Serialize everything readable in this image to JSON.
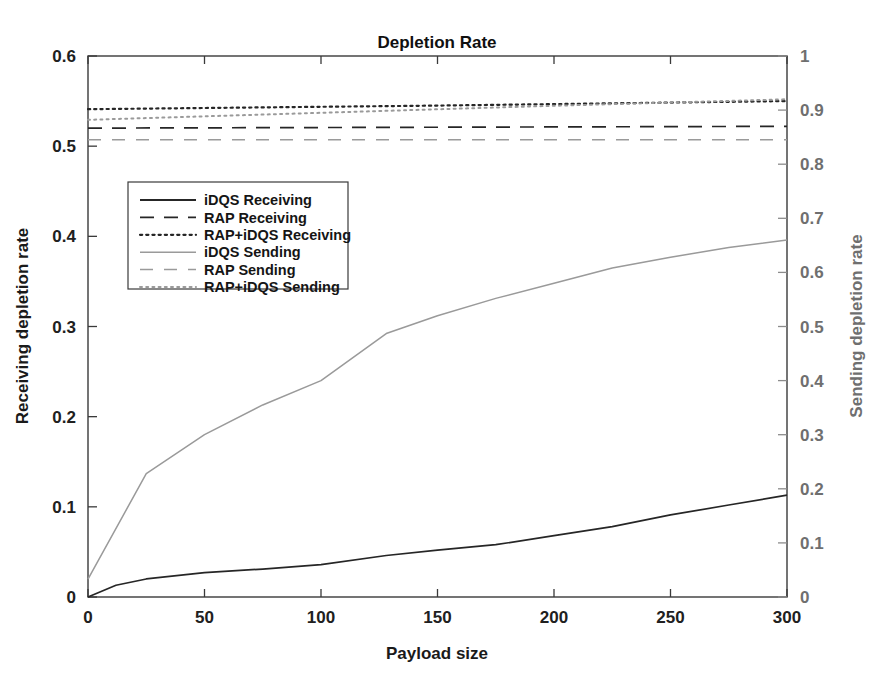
{
  "chart_data": {
    "type": "line",
    "title": "Depletion Rate",
    "xlabel": "Payload size",
    "ylabel": "Receiving depletion rate",
    "y2label": "Sending depletion rate",
    "xlim": [
      0,
      300
    ],
    "ylim": [
      0,
      0.6
    ],
    "y2lim": [
      0,
      1
    ],
    "grid": false,
    "legend_position": "upper-left-inside",
    "xticks": [
      "0",
      "50",
      "100",
      "150",
      "200",
      "250",
      "300"
    ],
    "xtick_values": [
      0,
      50,
      100,
      150,
      200,
      250,
      300
    ],
    "yticks": [
      "0",
      "0.1",
      "0.2",
      "0.3",
      "0.4",
      "0.5",
      "0.6"
    ],
    "ytick_values": [
      0,
      0.1,
      0.2,
      0.3,
      0.4,
      0.5,
      0.6
    ],
    "y2ticks": [
      "0",
      "0.1",
      "0.2",
      "0.3",
      "0.4",
      "0.5",
      "0.6",
      "0.7",
      "0.8",
      "0.9",
      "1"
    ],
    "y2tick_values": [
      0,
      0.1,
      0.2,
      0.3,
      0.4,
      0.5,
      0.6,
      0.7,
      0.8,
      0.9,
      1
    ],
    "series": [
      {
        "name": "iDQS Receiving",
        "axis": "left",
        "style": "solid",
        "color": "#262626",
        "x": [
          0,
          12,
          25,
          50,
          75,
          100,
          128,
          150,
          175,
          200,
          225,
          250,
          275,
          300
        ],
        "values": [
          0.0,
          0.013,
          0.02,
          0.027,
          0.031,
          0.036,
          0.046,
          0.052,
          0.058,
          0.068,
          0.078,
          0.091,
          0.102,
          0.113
        ]
      },
      {
        "name": "RAP Receiving",
        "axis": "left",
        "style": "dashed",
        "color": "#262626",
        "x": [
          0,
          300
        ],
        "values": [
          0.52,
          0.522
        ]
      },
      {
        "name": "RAP+iDQS Receiving",
        "axis": "left",
        "style": "dotted",
        "color": "#262626",
        "x": [
          0,
          150,
          300
        ],
        "values": [
          0.541,
          0.545,
          0.55
        ]
      },
      {
        "name": "iDQS Sending",
        "axis": "right",
        "style": "solid",
        "color": "#9a9a9a",
        "x": [
          0,
          25,
          50,
          75,
          100,
          128,
          150,
          175,
          200,
          225,
          250,
          275,
          300
        ],
        "values": [
          0.033,
          0.228,
          0.3,
          0.355,
          0.4,
          0.487,
          0.52,
          0.552,
          0.58,
          0.608,
          0.628,
          0.646,
          0.66
        ]
      },
      {
        "name": "RAP Sending",
        "axis": "right",
        "style": "dashed",
        "color": "#9a9a9a",
        "x": [
          0,
          300
        ],
        "values": [
          0.845,
          0.845
        ]
      },
      {
        "name": "RAP+iDQS Sending",
        "axis": "right",
        "style": "dotted",
        "color": "#9a9a9a",
        "x": [
          0,
          100,
          200,
          300
        ],
        "values": [
          0.882,
          0.895,
          0.908,
          0.92
        ]
      }
    ],
    "legend": [
      {
        "label": "iDQS Receiving",
        "style": "solid",
        "color": "#262626"
      },
      {
        "label": "RAP Receiving",
        "style": "dashed",
        "color": "#262626"
      },
      {
        "label": "RAP+iDQS Receiving",
        "style": "dotted",
        "color": "#262626"
      },
      {
        "label": "iDQS Sending",
        "style": "solid",
        "color": "#9a9a9a"
      },
      {
        "label": "RAP Sending",
        "style": "dashed",
        "color": "#9a9a9a"
      },
      {
        "label": "RAP+iDQS Sending",
        "style": "dotted",
        "color": "#9a9a9a"
      }
    ]
  }
}
